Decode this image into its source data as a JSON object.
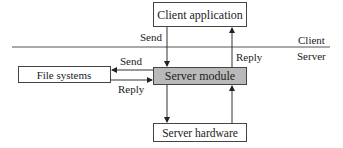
{
  "diagram": {
    "boxes": {
      "client_application": "Client application",
      "server_module": "Server module",
      "file_systems": "File systems",
      "server_hardware": "Server hardware"
    },
    "labels": {
      "send_top": "Send",
      "reply_top": "Reply",
      "send_left": "Send",
      "reply_left": "Reply",
      "client": "Client",
      "server": "Server"
    },
    "colors": {
      "server_module_fill": "#b9b9b9",
      "box_fill": "#ffffff",
      "stroke": "#444444"
    }
  }
}
